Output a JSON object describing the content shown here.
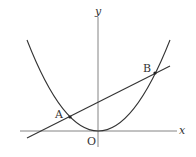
{
  "diagram": {
    "axes": {
      "x_label": "x",
      "y_label": "y",
      "origin_label": "O"
    },
    "points": [
      {
        "name": "A",
        "label": "A"
      },
      {
        "name": "B",
        "label": "B"
      }
    ],
    "curves": [
      "parabola y = a x^2",
      "line through A and B"
    ]
  }
}
